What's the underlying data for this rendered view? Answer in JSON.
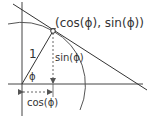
{
  "diagram": {
    "point_label": "(cos(ϕ), sin(ϕ))",
    "hypotenuse_label": "1",
    "angle_label": "ϕ",
    "vertical_label": "sin(ϕ)",
    "horizontal_label": "cos(ϕ)",
    "colors": {
      "stroke": "#333333",
      "background": "#ffffff"
    }
  }
}
